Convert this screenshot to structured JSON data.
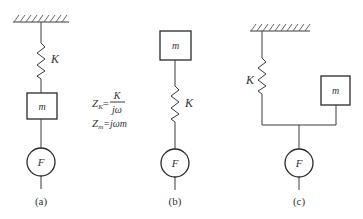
{
  "diagrams": [
    {
      "id": "a",
      "caption": "(a)",
      "spring_label": "K",
      "mass_label": "m",
      "force_label": "F"
    },
    {
      "id": "b",
      "caption": "(b)",
      "spring_label": "K",
      "mass_label": "m",
      "force_label": "F"
    },
    {
      "id": "c",
      "caption": "(c)",
      "spring_label": "K",
      "mass_label": "m",
      "force_label": "F"
    }
  ],
  "formulas": {
    "zk_lhs": "Z",
    "zk_sub": "K",
    "zk_eq": "=",
    "zk_num": "K",
    "zk_den": "jω",
    "zm_lhs": "Z",
    "zm_sub": "m",
    "zm_rhs": "=jωm"
  },
  "colors": {
    "stroke": "#2a2a2a",
    "background": "#ffffff"
  }
}
